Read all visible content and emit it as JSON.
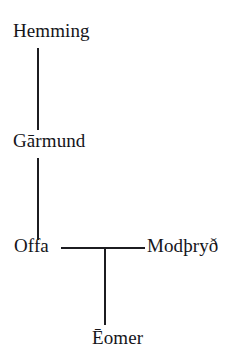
{
  "diagram": {
    "type": "family-tree",
    "background_color": "#ffffff",
    "text_color": "#15151a",
    "line_color": "#1c1c20",
    "nodes": [
      {
        "id": "hemming",
        "label": "Hemming",
        "generation": 1
      },
      {
        "id": "garmund",
        "label": "Gārmund",
        "generation": 2
      },
      {
        "id": "offa",
        "label": "Offa",
        "generation": 3
      },
      {
        "id": "modthryth",
        "label": "Modþryð",
        "generation": 3
      },
      {
        "id": "eomer",
        "label": "Ēomer",
        "generation": 4
      }
    ],
    "edges": [
      {
        "id": "hemming-garmund",
        "from": "hemming",
        "to": "garmund",
        "kind": "descent"
      },
      {
        "id": "garmund-offa",
        "from": "garmund",
        "to": "offa",
        "kind": "descent"
      },
      {
        "id": "offa-modthryth",
        "from": "offa",
        "to": "modthryth",
        "kind": "marriage"
      },
      {
        "id": "marriage-eomer",
        "from": "offa-modthryth",
        "to": "eomer",
        "kind": "descent"
      }
    ]
  }
}
